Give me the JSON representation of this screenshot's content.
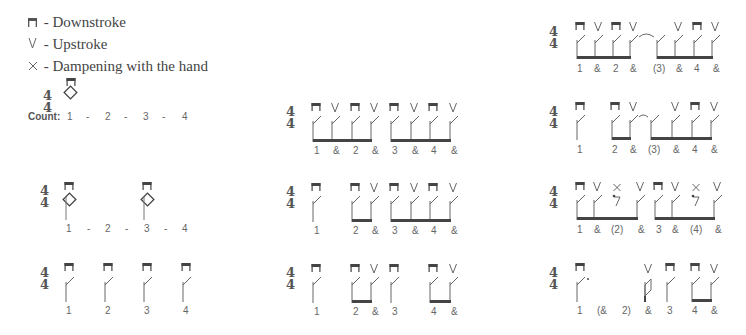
{
  "legend": {
    "items": [
      {
        "icon": "downstroke-icon",
        "glyph": "⊓",
        "label": "- Downstroke"
      },
      {
        "icon": "upstroke-icon",
        "glyph": "V",
        "label": "- Upstroke"
      },
      {
        "icon": "dampening-icon",
        "glyph": "×",
        "label": "- Dampening with the hand"
      }
    ]
  },
  "time_signature": {
    "top": "4",
    "bottom": "4"
  },
  "count_label": "Count:",
  "colors": {
    "ink": "#555555",
    "text": "#444444",
    "background": "#ffffff"
  },
  "patterns": [
    {
      "id": "L1",
      "column": "left",
      "counts": [
        "1",
        "-",
        "2",
        "-",
        "3",
        "-",
        "4"
      ],
      "strokes": [
        "down"
      ],
      "note": "whole note"
    },
    {
      "id": "L2",
      "column": "left",
      "counts": [
        "1",
        "-",
        "2",
        "-",
        "3",
        "-",
        "4"
      ],
      "strokes": [
        "down",
        "down"
      ],
      "note": "half notes"
    },
    {
      "id": "L3",
      "column": "left",
      "counts": [
        "1",
        "2",
        "3",
        "4"
      ],
      "strokes": [
        "down",
        "down",
        "down",
        "down"
      ],
      "note": "quarter notes"
    },
    {
      "id": "M1",
      "column": "middle",
      "counts": [
        "1",
        "&",
        "2",
        "&",
        "3",
        "&",
        "4",
        "&"
      ],
      "strokes": [
        "down",
        "up",
        "down",
        "up",
        "down",
        "up",
        "down",
        "up"
      ]
    },
    {
      "id": "M2",
      "column": "middle",
      "counts": [
        "1",
        "2",
        "&",
        "3",
        "&",
        "4",
        "&"
      ],
      "strokes": [
        "down",
        "down",
        "up",
        "down",
        "up",
        "down",
        "up"
      ]
    },
    {
      "id": "M3",
      "column": "middle",
      "counts": [
        "1",
        "2",
        "&",
        "3",
        "4",
        "&"
      ],
      "strokes": [
        "down",
        "down",
        "up",
        "down",
        "down",
        "up"
      ]
    },
    {
      "id": "R1",
      "column": "right",
      "counts": [
        "1",
        "&",
        "2",
        "&",
        "(3)",
        "&",
        "4",
        "&"
      ],
      "strokes": [
        "down",
        "up",
        "down",
        "up",
        "tie",
        "up",
        "down",
        "up"
      ]
    },
    {
      "id": "R2",
      "column": "right",
      "counts": [
        "1",
        "2",
        "&",
        "(3)",
        "&",
        "4",
        "&"
      ],
      "strokes": [
        "down",
        "down",
        "up",
        "tie",
        "up",
        "down",
        "up"
      ]
    },
    {
      "id": "R3",
      "column": "right",
      "counts": [
        "1",
        "&",
        "(2)",
        "&",
        "3",
        "&",
        "(4)",
        "&"
      ],
      "strokes": [
        "down",
        "up",
        "damp",
        "up",
        "down",
        "up",
        "damp",
        "up"
      ]
    },
    {
      "id": "R4",
      "column": "right",
      "counts": [
        "1",
        "(&",
        "2)",
        "&",
        "3",
        "4",
        "&"
      ],
      "strokes": [
        "down",
        "up",
        "down",
        "down",
        "up"
      ]
    }
  ]
}
